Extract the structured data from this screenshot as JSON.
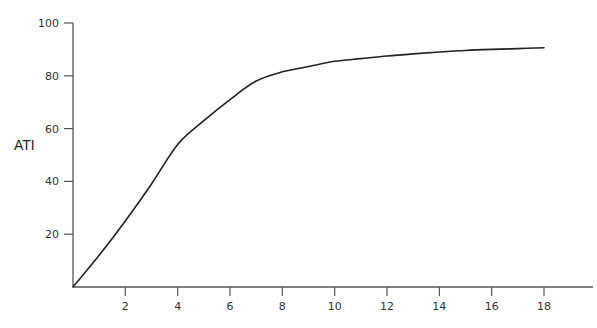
{
  "chart_data": {
    "type": "line",
    "title": "",
    "xlabel": "",
    "ylabel": "ATI",
    "x": [
      0,
      1,
      2,
      3,
      4,
      5,
      6,
      7,
      8,
      9,
      10,
      11,
      12,
      13,
      14,
      15,
      16,
      17,
      18
    ],
    "series": [
      {
        "name": "ATI",
        "values": [
          0,
          12,
          25,
          39,
          54,
          63,
          71,
          78,
          81.5,
          83.5,
          85.5,
          86.5,
          87.5,
          88.3,
          89,
          89.6,
          90,
          90.3,
          90.6
        ]
      }
    ],
    "xticks": [
      2,
      4,
      6,
      8,
      10,
      12,
      14,
      16,
      18
    ],
    "yticks": [
      20,
      40,
      60,
      80,
      100
    ],
    "xlim": [
      0,
      19.2
    ],
    "ylim": [
      0,
      100
    ],
    "grid": false,
    "legend": "none"
  },
  "colors": {
    "line": "#222222",
    "axis": "#555555",
    "text": "#333333"
  }
}
